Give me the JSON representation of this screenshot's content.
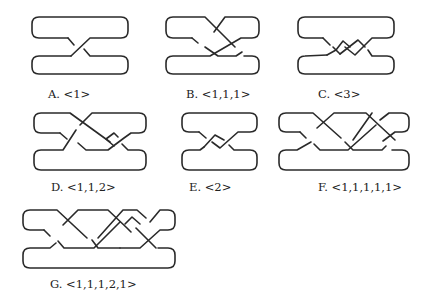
{
  "figures": [
    {
      "id": "A",
      "caption": "A. <1>",
      "notation": "<1>",
      "crossings": 1
    },
    {
      "id": "B",
      "caption": "B. <1,1,1>",
      "notation": "<1,1,1>",
      "crossings": 3
    },
    {
      "id": "C",
      "caption": "C. <3>",
      "notation": "<3>",
      "crossings": 3
    },
    {
      "id": "D",
      "caption": "D. <1,1,2>",
      "notation": "<1,1,2>",
      "crossings": 4
    },
    {
      "id": "E",
      "caption": "E. <2>",
      "notation": "<2>",
      "crossings": 2
    },
    {
      "id": "F",
      "caption": "F. <1,1,1,1,1>",
      "notation": "<1,1,1,1,1>",
      "crossings": 5
    },
    {
      "id": "G",
      "caption": "G. <1,1,1,2,1>",
      "notation": "<1,1,1,2,1>",
      "crossings": 6
    }
  ]
}
